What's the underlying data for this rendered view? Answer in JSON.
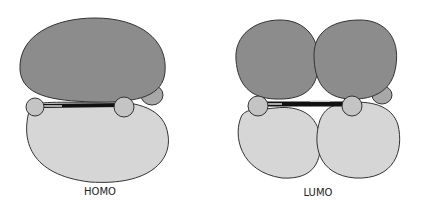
{
  "diagram": {
    "panels": [
      {
        "id": "homo",
        "label": "HOMO"
      },
      {
        "id": "lumo",
        "label": "LUMO"
      }
    ],
    "colors": {
      "dark_lobe": "#8c8c8c",
      "light_lobe": "#d6d6d6",
      "atom": "#c4c4c4",
      "outline": "#333333",
      "bond": "#111111"
    }
  }
}
